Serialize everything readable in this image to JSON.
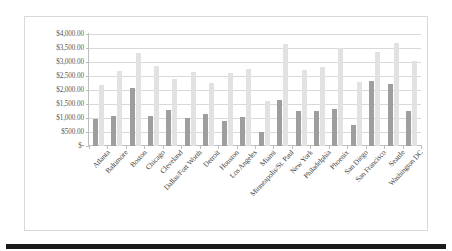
{
  "chart_data": {
    "type": "bar",
    "title": "",
    "subtitle": "",
    "xlabel": "",
    "ylabel": "",
    "ylim": [
      0,
      4000
    ],
    "grid": true,
    "legend_position": "none",
    "y_tick_labels": [
      "$4,000.00",
      "$3,500.00",
      "$3,000.00",
      "$2,500.00",
      "$2,000.00",
      "$1,500.00",
      "$1,000.00",
      "$500.00",
      "$-"
    ],
    "y_tick_values": [
      4000,
      3500,
      3000,
      2500,
      2000,
      1500,
      1000,
      500,
      0
    ],
    "categories": [
      "Atlanta",
      "Baltimore",
      "Boston",
      "Chicago",
      "Cleveland",
      "Dallas/Fort Worth",
      "Detroit",
      "Houston",
      "Los Angeles",
      "Miami",
      "Minneapolis/St. Paul",
      "New York",
      "Philadelphia",
      "Phoenix",
      "San Diego",
      "San Francisco",
      "Seattle",
      "Washington DC"
    ],
    "series": [
      {
        "name": "Series 1",
        "color": "#9e9e9e",
        "values": [
          950,
          1080,
          2060,
          1080,
          1280,
          1000,
          1140,
          890,
          1050,
          500,
          1640,
          1260,
          1240,
          1320,
          740,
          2320,
          2200,
          1240
        ]
      },
      {
        "name": "Series 2",
        "color": "#e2e2e2",
        "values": [
          2180,
          2690,
          3310,
          2870,
          2410,
          2650,
          2250,
          2600,
          2750,
          1600,
          3640,
          2710,
          2810,
          3500,
          2280,
          3340,
          3680,
          3020
        ]
      }
    ]
  }
}
